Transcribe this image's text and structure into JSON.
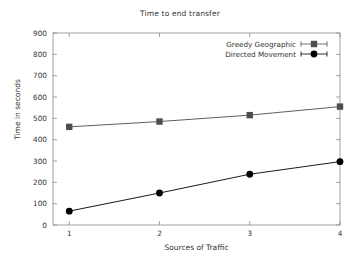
{
  "chart_data": {
    "type": "line",
    "title": "Time to end transfer",
    "xlabel": "Sources of Traffic",
    "ylabel": "Time in seconds",
    "x": [
      1,
      2,
      3,
      4
    ],
    "xtick_labels": [
      "1",
      "2",
      "3",
      "4"
    ],
    "ytick_labels": [
      "0",
      "100",
      "200",
      "300",
      "400",
      "500",
      "600",
      "700",
      "800",
      "900"
    ],
    "yticks": [
      0,
      100,
      200,
      300,
      400,
      500,
      600,
      700,
      800,
      900
    ],
    "ylim": [
      0,
      900
    ],
    "xlim": [
      0.82,
      4.0
    ],
    "grid": false,
    "legend_position": "top-right-inside",
    "series": [
      {
        "name": "Greedy Geographic",
        "marker": "square",
        "color": "#4d4d4d",
        "values": [
          460,
          485,
          515,
          555
        ]
      },
      {
        "name": "Directed Movement",
        "marker": "circle",
        "color": "#000000",
        "values": [
          65,
          150,
          238,
          297
        ]
      }
    ]
  }
}
